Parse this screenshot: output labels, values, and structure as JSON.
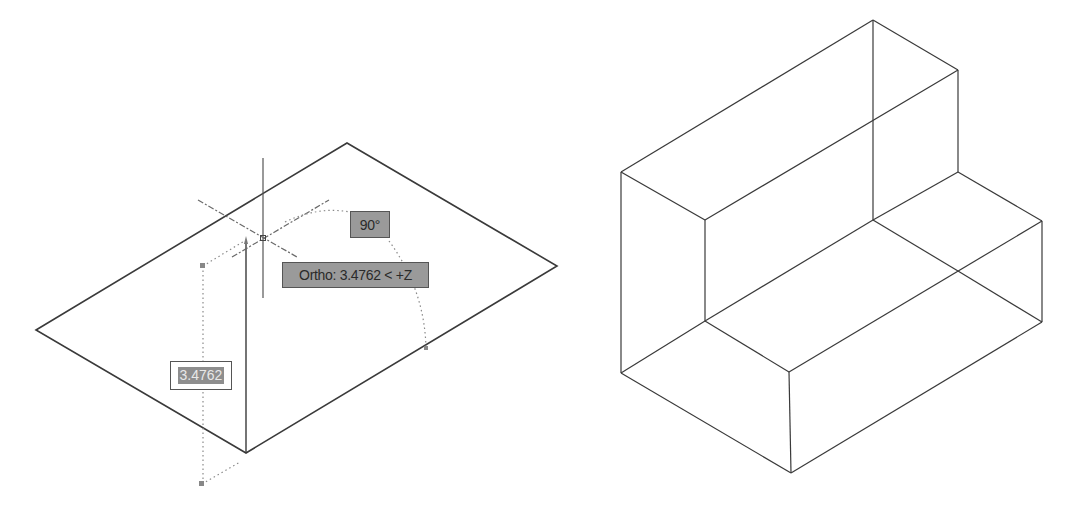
{
  "viewport_left": {
    "description": "AutoCAD extrude operation in progress",
    "angle_tooltip": "90°",
    "ortho_tooltip": "Ortho: 3.4762 < +Z",
    "dynamic_input_value": "3.4762"
  },
  "viewport_right": {
    "description": "Resulting L-shaped 3D wireframe solid"
  },
  "colors": {
    "line": "#3a3a3a",
    "tooltip_fill": "#9a9a9a",
    "tooltip_border": "#555555",
    "tracking_dash": "#8a8a8a"
  }
}
